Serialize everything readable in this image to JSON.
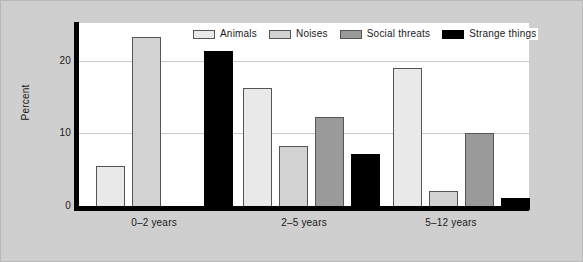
{
  "chart_data": {
    "type": "bar",
    "title": "",
    "xlabel": "",
    "ylabel": "Percent",
    "ylim": [
      0,
      25
    ],
    "yticks": [
      0,
      10,
      20
    ],
    "ytick_labels": [
      "0",
      "10",
      "20"
    ],
    "grid": true,
    "legend_position": "top-center",
    "categories": [
      "0–2 years",
      "2–5 years",
      "5–12 years"
    ],
    "series": [
      {
        "name": "Animals",
        "color": "#e9e9e9",
        "values": [
          6.1,
          16.9,
          19.7
        ]
      },
      {
        "name": "Noises",
        "color": "#d2d2d2",
        "values": [
          24.0,
          8.9,
          2.7
        ]
      },
      {
        "name": "Social threats",
        "color": "#9a9a9a",
        "values": [
          0.0,
          12.9,
          10.7
        ]
      },
      {
        "name": "Strange things",
        "color": "#000000",
        "values": [
          22.0,
          7.8,
          1.7
        ]
      }
    ]
  },
  "axes": {
    "y_title": "Percent",
    "y_tick_0": "0",
    "y_tick_10": "10",
    "y_tick_20": "20"
  },
  "categories": {
    "c0": "0–2 years",
    "c1": "2–5 years",
    "c2": "5–12 years"
  },
  "legend": {
    "items": [
      {
        "label": "Animals",
        "color": "#e9e9e9"
      },
      {
        "label": "Noises",
        "color": "#d2d2d2"
      },
      {
        "label": "Social threats",
        "color": "#9a9a9a"
      },
      {
        "label": "Strange things",
        "color": "#000000"
      }
    ]
  },
  "colors": {
    "background": "#cfcfcf",
    "plot_background": "#ffffff",
    "axis": "#000000",
    "gridline": "#c8c8c8",
    "text": "#1a1a1a"
  }
}
